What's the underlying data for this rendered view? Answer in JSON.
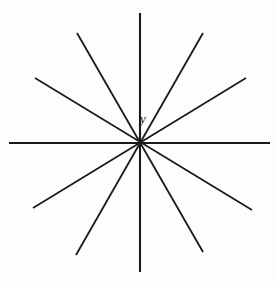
{
  "figure": {
    "type": "line-diagram",
    "canvas": {
      "width": 276,
      "height": 283
    },
    "background_color": "#fdfdfc",
    "line_color": "#1a1a1a",
    "center": {
      "x": 140,
      "y": 143
    },
    "label": {
      "text": "y",
      "x": 143,
      "y": 120,
      "style": "italic-serif",
      "color": "#101010",
      "font_size": 13
    },
    "line_count": 6,
    "spoke_count": 12,
    "angle_step_degrees": 30,
    "lines": [
      {
        "name": "horizontal-axis",
        "angle_degrees": 0,
        "stroke_width": 1.9,
        "x1": 9,
        "y1": 143,
        "x2": 270,
        "y2": 143
      },
      {
        "name": "vertical-axis",
        "angle_degrees": 90,
        "stroke_width": 2.1,
        "x1": 140,
        "y1": 13,
        "x2": 140,
        "y2": 272
      },
      {
        "name": "diagonal-steep-up-right",
        "angle_degrees": 60,
        "stroke_width": 1.8,
        "x1": 76,
        "y1": 255,
        "x2": 203,
        "y2": 33
      },
      {
        "name": "diagonal-steep-up-left",
        "angle_degrees": 120,
        "stroke_width": 1.8,
        "x1": 203,
        "y1": 252,
        "x2": 77,
        "y2": 33
      },
      {
        "name": "diagonal-shallow-up-right",
        "angle_degrees": 30,
        "stroke_width": 1.7,
        "x1": 33,
        "y1": 208,
        "x2": 246,
        "y2": 78
      },
      {
        "name": "diagonal-shallow-up-left",
        "angle_degrees": 150,
        "stroke_width": 1.7,
        "x1": 252,
        "y1": 210,
        "x2": 35,
        "y2": 78
      }
    ]
  }
}
